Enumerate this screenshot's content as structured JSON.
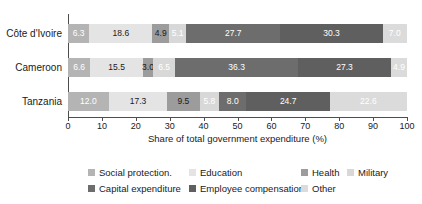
{
  "chart_data": {
    "type": "bar",
    "orientation": "horizontal",
    "stacked": true,
    "categories": [
      "Côte d'Ivoire",
      "Cameroon",
      "Tanzania"
    ],
    "series": [
      {
        "name": "Social protection.",
        "values": [
          6.3,
          6.6,
          12.0
        ],
        "color": "#b4b4b4",
        "label_color": "#ffffff"
      },
      {
        "name": "Education",
        "values": [
          18.6,
          15.5,
          17.3
        ],
        "color": "#e4e4e4",
        "label_color": "#1a1a1a"
      },
      {
        "name": "Health",
        "values": [
          4.9,
          3.0,
          9.5
        ],
        "color": "#9c9c9c",
        "label_color": "#1a1a1a"
      },
      {
        "name": "Military",
        "values": [
          5.1,
          6.5,
          5.8
        ],
        "color": "#d8d8d8",
        "label_color": "#ffffff"
      },
      {
        "name": "Capital expenditure",
        "values": [
          27.7,
          36.3,
          8.0
        ],
        "color": "#6d6d6d",
        "label_color": "#ffffff"
      },
      {
        "name": "Employee compensation",
        "values": [
          30.3,
          27.3,
          24.7
        ],
        "color": "#5f5f5f",
        "label_color": "#ffffff"
      },
      {
        "name": "Other",
        "values": [
          7.0,
          4.9,
          22.6
        ],
        "color": "#dbdbdb",
        "label_color": "#ffffff"
      }
    ],
    "xlabel": "Share of total government expenditure (%)",
    "xlim": [
      0,
      100
    ],
    "xticks": [
      0,
      10,
      20,
      30,
      40,
      50,
      60,
      70,
      80,
      90,
      100
    ],
    "grid": false,
    "legend_position": "bottom",
    "legend_rows": [
      [
        0,
        1,
        2,
        3
      ],
      [
        4,
        5,
        6
      ]
    ],
    "axis_color": "#4d4d4d"
  }
}
